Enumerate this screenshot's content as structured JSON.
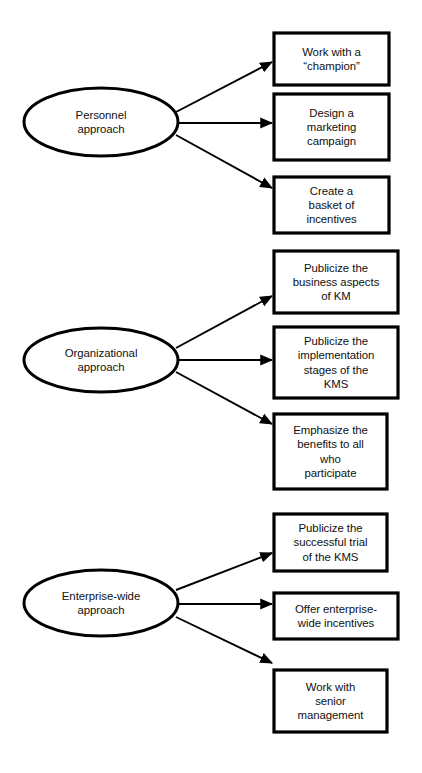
{
  "diagram": {
    "type": "flow-diagram",
    "stroke_color": "#000000",
    "text_color": "#101010",
    "background_color": "#ffffff",
    "groups": [
      {
        "id": "personnel",
        "source": {
          "name": "personnel-approach",
          "label": "Personnel\napproach",
          "shape": "ellipse",
          "x": 24,
          "y": 88,
          "w": 154,
          "h": 68
        },
        "targets": [
          {
            "name": "work-with-a-champion",
            "label": "Work with a\n“champion”",
            "shape": "rect",
            "x": 274,
            "y": 33,
            "w": 115,
            "h": 52
          },
          {
            "name": "design-a-marketing-campaign",
            "label": "Design a\nmarketing\ncampaign",
            "shape": "rect",
            "x": 274,
            "y": 94,
            "w": 115,
            "h": 66
          },
          {
            "name": "create-a-basket-of-incentives",
            "label": "Create a\nbasket of\nincentives",
            "shape": "rect",
            "x": 274,
            "y": 177,
            "w": 115,
            "h": 56
          }
        ]
      },
      {
        "id": "organizational",
        "source": {
          "name": "organizational-approach",
          "label": "Organizational\napproach",
          "shape": "ellipse",
          "x": 24,
          "y": 328,
          "w": 154,
          "h": 64
        },
        "targets": [
          {
            "name": "publicize-business-aspects-of-km",
            "label": "Publicize the\nbusiness aspects\nof KM",
            "shape": "rect",
            "x": 274,
            "y": 251,
            "w": 124,
            "h": 62
          },
          {
            "name": "publicize-implementation-stages-of-kms",
            "label": "Publicize the\nimplementation\nstages of the\nKMS",
            "shape": "rect",
            "x": 274,
            "y": 327,
            "w": 124,
            "h": 71
          },
          {
            "name": "emphasize-benefits-to-all-who-participate",
            "label": "Emphasize the\nbenefits to all\nwho\nparticipate",
            "shape": "rect",
            "x": 274,
            "y": 414,
            "w": 113,
            "h": 75
          }
        ]
      },
      {
        "id": "enterprise-wide",
        "source": {
          "name": "enterprise-wide-approach",
          "label": "Enterprise-wide\napproach",
          "shape": "ellipse",
          "x": 24,
          "y": 570,
          "w": 154,
          "h": 66
        },
        "targets": [
          {
            "name": "publicize-successful-trial-of-kms",
            "label": "Publicize the\nsuccessful trial\nof the KMS",
            "shape": "rect",
            "x": 274,
            "y": 514,
            "w": 113,
            "h": 57
          },
          {
            "name": "offer-enterprise-wide-incentives",
            "label": "Offer enterprise-\nwide incentives",
            "shape": "rect",
            "x": 274,
            "y": 593,
            "w": 124,
            "h": 46
          },
          {
            "name": "work-with-senior-management",
            "label": "Work with\nsenior\nmanagement",
            "shape": "rect",
            "x": 274,
            "y": 670,
            "w": 113,
            "h": 62
          }
        ]
      }
    ],
    "connectors": [
      {
        "name": "arrow-personnel-to-champion",
        "x1": 176,
        "y1": 112,
        "x2": 272,
        "y2": 62
      },
      {
        "name": "arrow-personnel-to-marketing",
        "x1": 179,
        "y1": 123,
        "x2": 272,
        "y2": 123
      },
      {
        "name": "arrow-personnel-to-incentives",
        "x1": 176,
        "y1": 135,
        "x2": 272,
        "y2": 188
      },
      {
        "name": "arrow-organizational-to-business-aspects",
        "x1": 176,
        "y1": 348,
        "x2": 272,
        "y2": 296
      },
      {
        "name": "arrow-organizational-to-implementation",
        "x1": 179,
        "y1": 360,
        "x2": 272,
        "y2": 360
      },
      {
        "name": "arrow-organizational-to-benefits",
        "x1": 176,
        "y1": 372,
        "x2": 272,
        "y2": 424
      },
      {
        "name": "arrow-enterprise-to-successful-trial",
        "x1": 176,
        "y1": 590,
        "x2": 272,
        "y2": 553
      },
      {
        "name": "arrow-enterprise-to-incentives",
        "x1": 179,
        "y1": 604,
        "x2": 272,
        "y2": 604
      },
      {
        "name": "arrow-enterprise-to-senior-management",
        "x1": 176,
        "y1": 617,
        "x2": 272,
        "y2": 663
      }
    ]
  }
}
